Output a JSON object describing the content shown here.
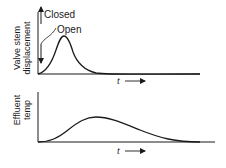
{
  "top_plot": {
    "ylabel_line1": "Valve stem",
    "ylabel_line2": "displacement",
    "annotation_closed": "Closed",
    "annotation_open": "Open",
    "xlabel": "t"
  },
  "bottom_plot": {
    "ylabel_line1": "Effluent",
    "ylabel_line2": "temp",
    "xlabel": "t"
  },
  "colors": {
    "ink": "#1a1a1a",
    "background": "#ffffff"
  }
}
